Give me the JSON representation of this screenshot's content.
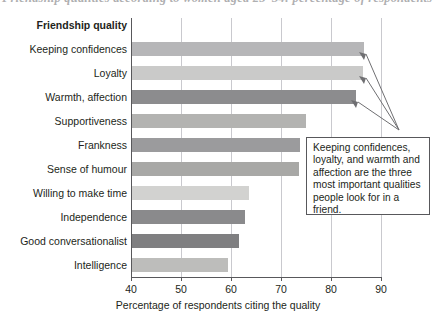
{
  "caption": {
    "text": "Friendship qualities according to women aged 25–34: percentage of respondents"
  },
  "chart_data": {
    "type": "bar",
    "orientation": "horizontal",
    "title": "",
    "xlabel": "Percentage of respondents citing the quality",
    "ylabel": "Friendship quality",
    "xlim": [
      40,
      90
    ],
    "xticks": [
      40,
      50,
      60,
      70,
      80,
      90
    ],
    "grid": "vertical",
    "legend": "none",
    "categories": [
      "Keeping confidences",
      "Loyalty",
      "Warmth, affection",
      "Supportiveness",
      "Frankness",
      "Sense of humour",
      "Willing to make time",
      "Independence",
      "Good conversationalist",
      "Intelligence"
    ],
    "values": [
      86.4,
      86.2,
      84.8,
      74.8,
      73.6,
      73.4,
      63.4,
      62.6,
      61.4,
      59.2
    ],
    "bar_colors": [
      "#b6b6b8",
      "#cacac9",
      "#8c8c8e",
      "#b3b3b1",
      "#9b9b9d",
      "#a8a8a6",
      "#d2d2d0",
      "#8a8a8c",
      "#7f7f81",
      "#bdbdbb"
    ],
    "annotations": [
      {
        "text": "Keeping confidences, loyalty, and warmth and affection are the three most important qualities people look for in a friend.",
        "points_to": [
          "Keeping confidences",
          "Loyalty",
          "Warmth, affection"
        ]
      }
    ]
  },
  "axis": {
    "tick_labels": [
      "40",
      "50",
      "60",
      "70",
      "80",
      "90"
    ],
    "x_title": "Percentage of respondents citing the quality",
    "group_header": "Friendship quality"
  },
  "colors": {
    "axis": "#58585b",
    "grid": "#c9c9ce",
    "text": "#231f20",
    "callout_border": "#58585b"
  }
}
